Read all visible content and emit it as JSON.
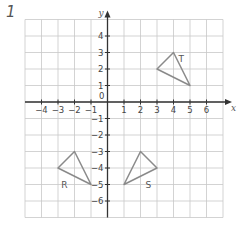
{
  "question_number": "1",
  "diagram": {
    "type": "coordinate-grid",
    "x_axis": {
      "label": "x",
      "min": -5,
      "max": 7,
      "ticks": [
        -4,
        -3,
        -2,
        -1,
        1,
        2,
        3,
        4,
        5,
        6
      ]
    },
    "y_axis": {
      "label": "y",
      "min": -7,
      "max": 5,
      "ticks": [
        4,
        3,
        2,
        1,
        -1,
        -2,
        -3,
        -4,
        -5,
        -6
      ]
    },
    "origin_label": "0",
    "colors": {
      "grid": "#c8c8c8",
      "axis": "#333333",
      "shape": "#8a8a8a",
      "text": "#444444"
    },
    "shapes": [
      {
        "label": "T",
        "vertices": [
          [
            3,
            2
          ],
          [
            4,
            3
          ],
          [
            5,
            1
          ]
        ],
        "label_pos": [
          4.3,
          2.6
        ]
      },
      {
        "label": "R",
        "vertices": [
          [
            -3,
            -4
          ],
          [
            -2,
            -3
          ],
          [
            -1,
            -5
          ]
        ],
        "label_pos": [
          -2.8,
          -5.0
        ]
      },
      {
        "label": "S",
        "vertices": [
          [
            1,
            -5
          ],
          [
            2,
            -3
          ],
          [
            3,
            -4
          ]
        ],
        "label_pos": [
          2.3,
          -5.0
        ]
      }
    ]
  }
}
